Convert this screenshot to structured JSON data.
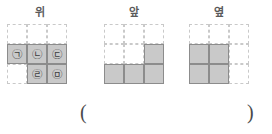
{
  "problem": {
    "answer_blank": {
      "open_paren": "(",
      "close_paren": ")"
    }
  },
  "figures": [
    {
      "id": "top-view",
      "label": "위",
      "grid": {
        "rows": 3,
        "cols": 3,
        "cells": [
          [
            {
              "filled": false,
              "glyph": ""
            },
            {
              "filled": false,
              "glyph": ""
            },
            {
              "filled": false,
              "glyph": ""
            }
          ],
          [
            {
              "filled": true,
              "glyph": "㉠"
            },
            {
              "filled": true,
              "glyph": "㉡"
            },
            {
              "filled": true,
              "glyph": "㉢"
            }
          ],
          [
            {
              "filled": false,
              "glyph": ""
            },
            {
              "filled": true,
              "glyph": "㉣"
            },
            {
              "filled": true,
              "glyph": "㉤"
            }
          ]
        ]
      }
    },
    {
      "id": "front-view",
      "label": "앞",
      "grid": {
        "rows": 3,
        "cols": 3,
        "cells": [
          [
            {
              "filled": false,
              "glyph": ""
            },
            {
              "filled": false,
              "glyph": ""
            },
            {
              "filled": false,
              "glyph": ""
            }
          ],
          [
            {
              "filled": false,
              "glyph": ""
            },
            {
              "filled": false,
              "glyph": ""
            },
            {
              "filled": true,
              "glyph": ""
            }
          ],
          [
            {
              "filled": true,
              "glyph": ""
            },
            {
              "filled": true,
              "glyph": ""
            },
            {
              "filled": true,
              "glyph": ""
            }
          ]
        ]
      }
    },
    {
      "id": "side-view",
      "label": "옆",
      "grid": {
        "rows": 3,
        "cols": 3,
        "cells": [
          [
            {
              "filled": false,
              "glyph": ""
            },
            {
              "filled": false,
              "glyph": ""
            },
            {
              "filled": false,
              "glyph": ""
            }
          ],
          [
            {
              "filled": true,
              "glyph": ""
            },
            {
              "filled": true,
              "glyph": ""
            },
            {
              "filled": false,
              "glyph": ""
            }
          ],
          [
            {
              "filled": true,
              "glyph": ""
            },
            {
              "filled": true,
              "glyph": ""
            },
            {
              "filled": false,
              "glyph": ""
            }
          ]
        ]
      }
    }
  ],
  "colors": {
    "cell_fill": "#c9c9c9",
    "cell_border": "#8c8c8c",
    "grid_dash": "#c9c9c9",
    "label_text": "#5a5a5a",
    "glyph_text": "#3d3d3d"
  }
}
